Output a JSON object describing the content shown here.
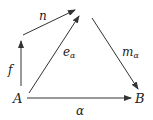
{
  "diagram": {
    "type": "commutative-diagram",
    "nodes": [
      {
        "id": "A",
        "label": "A",
        "x": 18,
        "y": 103
      },
      {
        "id": "B",
        "label": "B",
        "x": 141,
        "y": 103
      },
      {
        "id": "top",
        "label": "",
        "x": 82,
        "y": 12
      },
      {
        "id": "mid",
        "label": "",
        "x": 21,
        "y": 38
      }
    ],
    "edges": [
      {
        "from": "A",
        "to": "B",
        "label": "α",
        "name": "alpha"
      },
      {
        "from": "A",
        "to": "mid",
        "label": "f",
        "name": "f"
      },
      {
        "from": "mid",
        "to": "top",
        "label": "n",
        "name": "n"
      },
      {
        "from": "A",
        "to": "top",
        "label": "e",
        "sub": "α",
        "name": "e-alpha"
      },
      {
        "from": "top",
        "to": "B",
        "label": "m",
        "sub": "α",
        "name": "m-alpha"
      }
    ],
    "colors": {
      "stroke": "#333333",
      "text": "#222222"
    }
  }
}
